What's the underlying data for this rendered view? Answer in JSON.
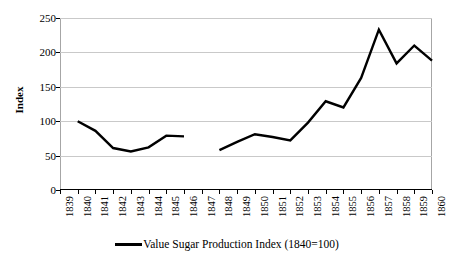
{
  "chart_data": {
    "type": "line",
    "title": "",
    "xlabel": "",
    "ylabel": "Index",
    "ylim": [
      0,
      250
    ],
    "yticks": [
      0,
      50,
      100,
      150,
      200,
      250
    ],
    "grid": true,
    "legend_position": "bottom-center",
    "x": [
      1839,
      1840,
      1841,
      1842,
      1843,
      1844,
      1845,
      1846,
      1847,
      1848,
      1849,
      1850,
      1851,
      1852,
      1853,
      1854,
      1855,
      1856,
      1857,
      1858,
      1859,
      1860
    ],
    "categories": [
      "1839",
      "1840",
      "1841",
      "1842",
      "1843",
      "1844",
      "1845",
      "1846",
      "1847",
      "1848",
      "1849",
      "1850",
      "1851",
      "1852",
      "1853",
      "1854",
      "1855",
      "1856",
      "1857",
      "1858",
      "1859",
      "1860"
    ],
    "series": [
      {
        "name": "Value Sugar Production Index (1840=100)",
        "color": "#000000",
        "values": [
          null,
          100,
          86,
          61,
          56,
          62,
          79,
          78,
          null,
          58,
          70,
          81,
          77,
          72,
          98,
          129,
          120,
          163,
          233,
          184,
          210,
          188
        ]
      }
    ],
    "annotations": [
      "Gap in series: no data for 1839 and 1847"
    ]
  },
  "axes": {
    "y_title": "Index",
    "y_ticks": [
      "250",
      "200",
      "150",
      "100",
      "50",
      "0"
    ],
    "x_ticks": [
      "1839",
      "1840",
      "1841",
      "1842",
      "1843",
      "1844",
      "1845",
      "1846",
      "1847",
      "1848",
      "1849",
      "1850",
      "1851",
      "1852",
      "1853",
      "1854",
      "1855",
      "1856",
      "1857",
      "1858",
      "1859",
      "1860"
    ]
  },
  "legend": {
    "items": [
      {
        "label": "Value Sugar Production Index (1840=100)",
        "color": "#000000"
      }
    ]
  },
  "colors": {
    "series": "#000000",
    "gridline": "#c9c9c9",
    "frame": "#a6a6a6",
    "axis": "#000000",
    "background": "#ffffff"
  }
}
